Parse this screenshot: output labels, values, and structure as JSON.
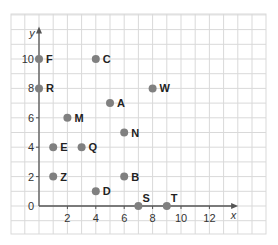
{
  "chart_data": {
    "type": "scatter",
    "title": "",
    "xlabel": "x",
    "ylabel": "y",
    "xlim": [
      0,
      13
    ],
    "ylim": [
      0,
      11
    ],
    "grid": true,
    "x_ticks": [
      "0",
      "2",
      "4",
      "6",
      "8",
      "10",
      "12"
    ],
    "y_ticks": [
      "0",
      "2",
      "4",
      "6",
      "8",
      "10"
    ],
    "points": [
      {
        "label": "F",
        "x": 0,
        "y": 10
      },
      {
        "label": "R",
        "x": 0,
        "y": 8
      },
      {
        "label": "C",
        "x": 4,
        "y": 10
      },
      {
        "label": "A",
        "x": 5,
        "y": 7
      },
      {
        "label": "W",
        "x": 8,
        "y": 8
      },
      {
        "label": "M",
        "x": 2,
        "y": 6
      },
      {
        "label": "N",
        "x": 6,
        "y": 5
      },
      {
        "label": "E",
        "x": 1,
        "y": 4
      },
      {
        "label": "Q",
        "x": 3,
        "y": 4
      },
      {
        "label": "Z",
        "x": 1,
        "y": 2
      },
      {
        "label": "B",
        "x": 6,
        "y": 2
      },
      {
        "label": "D",
        "x": 4,
        "y": 1
      },
      {
        "label": "S",
        "x": 7,
        "y": 0
      },
      {
        "label": "T",
        "x": 9,
        "y": 0
      }
    ],
    "colors": {
      "point": "#808080",
      "axis": "#555555",
      "grid": "#d9d9d9"
    }
  }
}
